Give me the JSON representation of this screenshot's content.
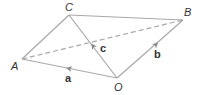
{
  "diagram": {
    "points": {
      "A": {
        "label": "A",
        "x": 22,
        "y": 59,
        "lx": 11,
        "ly": 70
      },
      "C": {
        "label": "C",
        "x": 69,
        "y": 15,
        "lx": 65,
        "ly": 11
      },
      "B": {
        "label": "B",
        "x": 183,
        "y": 20,
        "lx": 184,
        "ly": 16
      },
      "O": {
        "label": "O",
        "x": 117,
        "y": 78,
        "lx": 114,
        "ly": 91
      }
    },
    "vectors": {
      "a": {
        "label": "a",
        "from": "O",
        "to": "A",
        "lx": 65,
        "ly": 82
      },
      "b": {
        "label": "b",
        "from": "O",
        "to": "B",
        "lx": 154,
        "ly": 58
      },
      "c": {
        "label": "c",
        "from": "O",
        "to": "C",
        "lx": 100,
        "ly": 52
      }
    },
    "segments": [
      {
        "from": "A",
        "to": "C",
        "style": "solid"
      },
      {
        "from": "C",
        "to": "B",
        "style": "solid"
      },
      {
        "from": "A",
        "to": "B",
        "style": "dashed"
      }
    ],
    "colors": {
      "line": "#a8a8a8",
      "text": "#333333"
    }
  }
}
